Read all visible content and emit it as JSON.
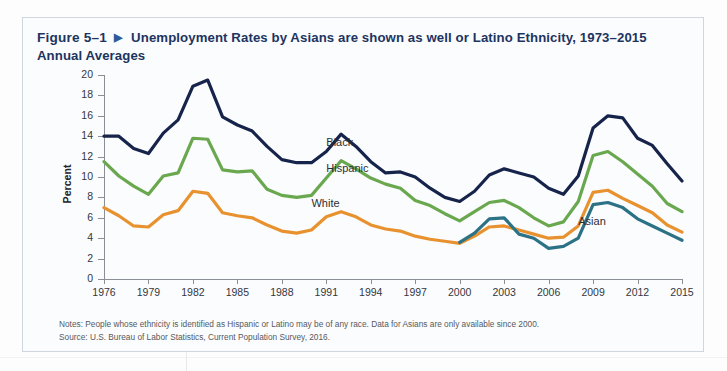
{
  "figure": {
    "number": "Figure 5–1",
    "arrow_icon": "triangle-right-icon",
    "title": "Unemployment Rates by Asians are shown as well or Latino Ethnicity, 1973–2015 Annual Averages"
  },
  "notes": {
    "line1": "Notes: People whose ethnicity is identified as Hispanic or Latino may be of any race. Data for Asians are only available since 2000.",
    "line2": "Source: U.S. Bureau of Labor Statistics, Current Population Survey, 2016."
  },
  "colors": {
    "black_series": "#16234a",
    "hispanic_series": "#6aa84f",
    "white_series": "#e8922f",
    "asian_series": "#2b7287",
    "title": "#1d3461",
    "frame": "#cfd6e0",
    "axis": "#8a8f96"
  },
  "chart_data": {
    "type": "line",
    "title": "Unemployment Rates by Asians are shown as well or Latino Ethnicity, 1973–2015 Annual Averages",
    "xlabel": "",
    "ylabel": "Percent",
    "ylim": [
      0,
      20
    ],
    "xlim": [
      1976,
      2015
    ],
    "ytick_step": 2,
    "yticks": [
      0,
      2,
      4,
      6,
      8,
      10,
      12,
      14,
      16,
      18,
      20
    ],
    "xticks": [
      1976,
      1979,
      1982,
      1985,
      1988,
      1991,
      1994,
      1997,
      2000,
      2003,
      2006,
      2009,
      2012,
      2015
    ],
    "grid": false,
    "legend": "inline-labels",
    "x": [
      1976,
      1977,
      1978,
      1979,
      1980,
      1981,
      1982,
      1983,
      1984,
      1985,
      1986,
      1987,
      1988,
      1989,
      1990,
      1991,
      1992,
      1993,
      1994,
      1995,
      1996,
      1997,
      1998,
      1999,
      2000,
      2001,
      2002,
      2003,
      2004,
      2005,
      2006,
      2007,
      2008,
      2009,
      2010,
      2011,
      2012,
      2013,
      2014,
      2015
    ],
    "series": [
      {
        "name": "Black",
        "color": "#16234a",
        "label_x": 1991,
        "label_y": 13.2,
        "values": [
          14.0,
          14.0,
          12.8,
          12.3,
          14.3,
          15.6,
          18.9,
          19.5,
          15.9,
          15.1,
          14.5,
          13.0,
          11.7,
          11.4,
          11.4,
          12.5,
          14.2,
          13.0,
          11.5,
          10.4,
          10.5,
          10.0,
          8.9,
          8.0,
          7.6,
          8.6,
          10.2,
          10.8,
          10.4,
          10.0,
          8.9,
          8.3,
          10.1,
          14.8,
          16.0,
          15.8,
          13.8,
          13.1,
          11.3,
          9.6
        ]
      },
      {
        "name": "Hispanic",
        "color": "#6aa84f",
        "label_x": 1991,
        "label_y": 10.7,
        "values": [
          11.5,
          10.1,
          9.1,
          8.3,
          10.1,
          10.4,
          13.8,
          13.7,
          10.7,
          10.5,
          10.6,
          8.8,
          8.2,
          8.0,
          8.2,
          9.9,
          11.6,
          10.8,
          9.9,
          9.3,
          8.9,
          7.7,
          7.2,
          6.4,
          5.7,
          6.6,
          7.5,
          7.7,
          7.0,
          6.0,
          5.2,
          5.6,
          7.6,
          12.1,
          12.5,
          11.5,
          10.3,
          9.1,
          7.4,
          6.6
        ]
      },
      {
        "name": "White",
        "color": "#e8922f",
        "label_x": 1990,
        "label_y": 7.3,
        "values": [
          7.0,
          6.2,
          5.2,
          5.1,
          6.3,
          6.7,
          8.6,
          8.4,
          6.5,
          6.2,
          6.0,
          5.3,
          4.7,
          4.5,
          4.8,
          6.1,
          6.6,
          6.1,
          5.3,
          4.9,
          4.7,
          4.2,
          3.9,
          3.7,
          3.5,
          4.2,
          5.1,
          5.2,
          4.8,
          4.4,
          4.0,
          4.1,
          5.2,
          8.5,
          8.7,
          7.9,
          7.2,
          6.5,
          5.3,
          4.6
        ]
      },
      {
        "name": "Asian",
        "color": "#2b7287",
        "label_x": 2008,
        "label_y": 5.5,
        "start_year": 2000,
        "values": [
          null,
          null,
          null,
          null,
          null,
          null,
          null,
          null,
          null,
          null,
          null,
          null,
          null,
          null,
          null,
          null,
          null,
          null,
          null,
          null,
          null,
          null,
          null,
          null,
          3.6,
          4.5,
          5.9,
          6.0,
          4.4,
          4.0,
          3.0,
          3.2,
          4.0,
          7.3,
          7.5,
          7.0,
          5.9,
          5.2,
          4.5,
          3.8
        ]
      }
    ]
  }
}
